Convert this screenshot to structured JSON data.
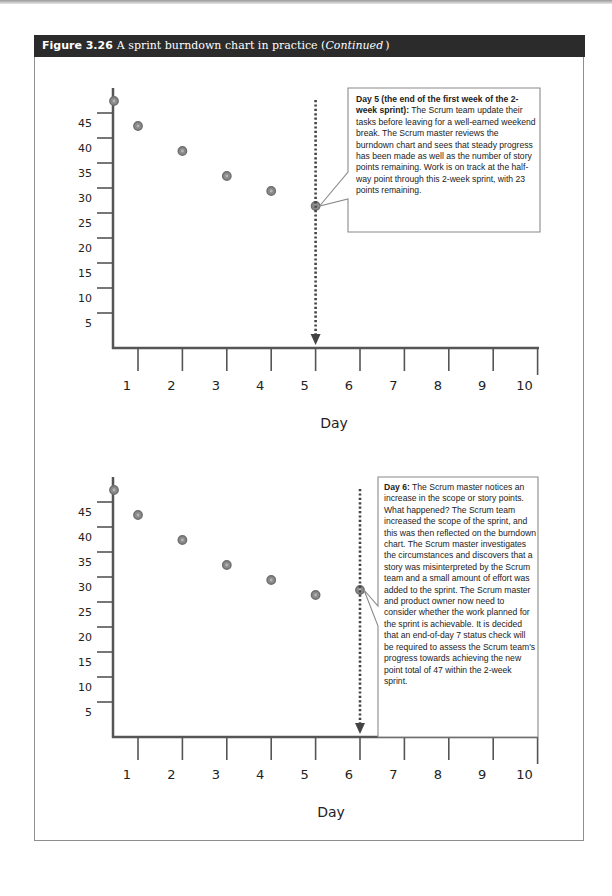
{
  "figure": {
    "number": "Figure 3.26",
    "title": "A sprint burndown chart in practice (",
    "continued": "Continued",
    "close_paren": ")"
  },
  "charts": [
    {
      "id": "day5",
      "callout": {
        "lead": "Day 5 (the end of the first week of the 2-week sprint):",
        "body": "The Scrum team update their tasks before leaving for a well-earned weekend break. The Scrum master reviews the burndown chart and sees that steady progress has been made as well as the number of story points remaining. Work is on track at the half-way point through this 2-week sprint, with 23 points remaining."
      }
    },
    {
      "id": "day6",
      "callout": {
        "lead": "Day 6:",
        "body": "The Scrum master notices an increase in the scope or story points. What happened? The Scrum team increased the scope of the sprint, and this was then reflected on the burndown chart. The Scrum master investigates the circumstances and discovers that a story was misinterpreted by the Scrum team and a small amount of effort was added to the sprint. The Scrum master and product owner now need to consider whether the work planned for the sprint is achievable. It is decided that an end-of-day 7 status check will be required to assess the Scrum team's progress towards achieving the new point total of 47 within the 2-week sprint."
      }
    }
  ],
  "axis": {
    "y_ticks": [
      "45",
      "40",
      "35",
      "30",
      "25",
      "20",
      "15",
      "10",
      "5"
    ],
    "x_ticks": [
      "1",
      "2",
      "3",
      "4",
      "5",
      "6",
      "7",
      "8",
      "9",
      "10"
    ],
    "x_title": "Day"
  },
  "colors": {
    "header_bg": "#2b2b2b",
    "axis": "#555555",
    "point": "#8a8a8a",
    "point_ring": "#6e6e6e",
    "marker_line": "#444444"
  },
  "chart_data": [
    {
      "type": "scatter",
      "title": "A sprint burndown chart in practice (Continued) — Day 5",
      "xlabel": "Day",
      "ylabel": "",
      "x": [
        0,
        1,
        2,
        3,
        4,
        5
      ],
      "y": [
        47,
        42,
        37,
        32,
        29,
        26
      ],
      "xlim": [
        0,
        10
      ],
      "ylim": [
        0,
        50
      ],
      "x_ticks": [
        1,
        2,
        3,
        4,
        5,
        6,
        7,
        8,
        9,
        10
      ],
      "y_ticks": [
        5,
        10,
        15,
        20,
        25,
        30,
        35,
        40,
        45
      ],
      "grid": false,
      "legend": null,
      "annotations": [
        {
          "type": "vertical-dotted-arrow",
          "x": 5,
          "text": "Day 5 (the end of the first week of the 2-week sprint): The Scrum team update their tasks before leaving for a well-earned weekend break. The Scrum master reviews the burndown chart and sees that steady progress has been made as well as the number of story points remaining. Work is on track at the half-way point through this 2-week sprint, with 23 points remaining."
        }
      ]
    },
    {
      "type": "scatter",
      "title": "A sprint burndown chart in practice (Continued) — Day 6",
      "xlabel": "Day",
      "ylabel": "",
      "x": [
        0,
        1,
        2,
        3,
        4,
        5,
        6
      ],
      "y": [
        47,
        42,
        37,
        32,
        29,
        26,
        27
      ],
      "xlim": [
        0,
        10
      ],
      "ylim": [
        0,
        50
      ],
      "x_ticks": [
        1,
        2,
        3,
        4,
        5,
        6,
        7,
        8,
        9,
        10
      ],
      "y_ticks": [
        5,
        10,
        15,
        20,
        25,
        30,
        35,
        40,
        45
      ],
      "grid": false,
      "legend": null,
      "annotations": [
        {
          "type": "vertical-dotted-arrow",
          "x": 6,
          "text": "Day 6: The Scrum master notices an increase in the scope or story points. What happened? The Scrum team increased the scope of the sprint, and this was then reflected on the burndown chart. The Scrum master investigates the circumstances and discovers that a story was misinterpreted by the Scrum team and a small amount of effort was added to the sprint. The Scrum master and product owner now need to consider whether the work planned for the sprint is achievable. It is decided that an end-of-day 7 status check will be required to assess the Scrum team's progress towards achieving the new point total of 47 within the 2-week sprint."
        }
      ]
    }
  ]
}
